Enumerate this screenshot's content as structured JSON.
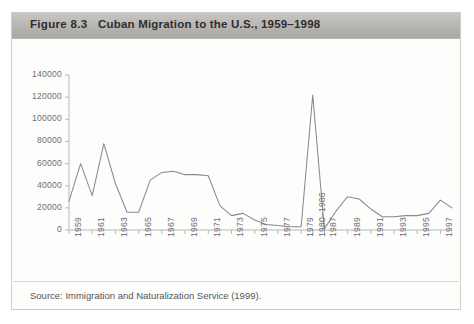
{
  "figure": {
    "label": "Figure 8.3",
    "title": "Cuban Migration to the U.S., 1959–1998",
    "source": "Source: Immigration and Naturalization Service (1999)."
  },
  "colors": {
    "header_band": "#b6b4b0",
    "line": "#8a8a8e",
    "axis": "#b8b7bb",
    "tick_text": "#6e6d72",
    "frame": "#cfcdc8",
    "page": "#ffffff"
  },
  "chart_data": {
    "type": "line",
    "title": "Cuban Migration to the U.S., 1959–1998",
    "xlabel": "",
    "ylabel": "",
    "ylim": [
      0,
      140000
    ],
    "ytick_values": [
      0,
      20000,
      40000,
      60000,
      80000,
      100000,
      120000,
      140000
    ],
    "ytick_labels": [
      "0",
      "20000",
      "40000",
      "60000",
      "80000",
      "100000",
      "120000",
      "140000"
    ],
    "grid": false,
    "legend": "none",
    "categories": [
      "1959",
      "1960",
      "1961",
      "1962",
      "1963",
      "1964",
      "1965",
      "1966",
      "1967",
      "1968",
      "1969",
      "1970",
      "1971",
      "1972",
      "1973",
      "1974",
      "1975",
      "1976",
      "1977",
      "1978",
      "1979",
      "1980–1986",
      "1987",
      "1988",
      "1989",
      "1990",
      "1991",
      "1992",
      "1993",
      "1994",
      "1995",
      "1996",
      "1997",
      "1998"
    ],
    "xtick_labels": [
      "1959",
      "1961",
      "1963",
      "1965",
      "1967",
      "1969",
      "1971",
      "1973",
      "1975",
      "1977",
      "1979",
      "1980–1986",
      "1987",
      "1989",
      "1991",
      "1993",
      "1995",
      "1997"
    ],
    "values": [
      26000,
      60000,
      31000,
      78000,
      42000,
      16000,
      16000,
      45000,
      52000,
      53000,
      50000,
      50000,
      49000,
      22000,
      13000,
      15000,
      9000,
      5000,
      4000,
      3000,
      3000,
      122000,
      1000,
      17000,
      30000,
      28000,
      19000,
      12000,
      12000,
      13000,
      13000,
      15000,
      27000,
      20000
    ],
    "annotations": [
      {
        "text": "1980–1986 Mariel boatlift period spike",
        "value": 122000
      }
    ]
  }
}
